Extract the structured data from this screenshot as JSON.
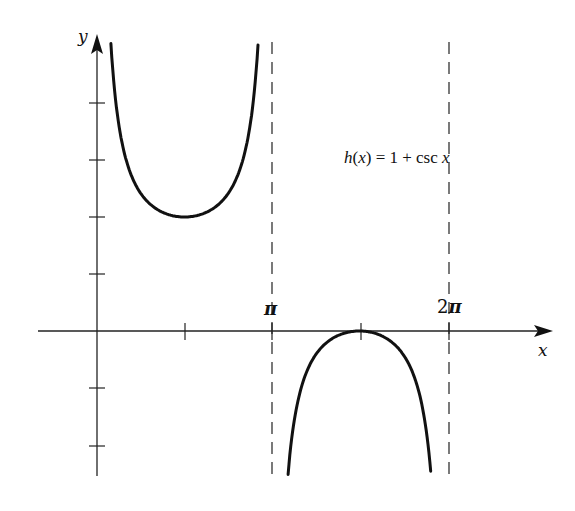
{
  "chart_data": {
    "type": "line",
    "title": "",
    "function": "h(x) = 1 + csc x",
    "equation_label": {
      "name": "h",
      "arg": "x",
      "rhs_const": "1",
      "rhs_func": "csc x"
    },
    "xlabel": "x",
    "ylabel": "y",
    "x_ticks": [
      {
        "value": 1.5708,
        "label": ""
      },
      {
        "value": 3.1416,
        "label": "π"
      },
      {
        "value": 4.7124,
        "label": ""
      },
      {
        "value": 6.2832,
        "label": "2π"
      }
    ],
    "y_ticks": [
      -2,
      -1,
      1,
      2,
      3,
      4
    ],
    "y_tick_labels_shown": false,
    "asymptotes": [
      {
        "x": 3.1416,
        "label": "π",
        "style": "dashed"
      },
      {
        "x": 6.2832,
        "label": "2π",
        "style": "dashed"
      }
    ],
    "series": [
      {
        "name": "upper branch",
        "domain": [
          0.25,
          2.89
        ],
        "key_points": [
          {
            "x": 1.5708,
            "y": 2,
            "kind": "local minimum"
          }
        ]
      },
      {
        "name": "lower branch",
        "domain": [
          3.43,
          5.99
        ],
        "key_points": [
          {
            "x": 4.7124,
            "y": 0,
            "kind": "local maximum"
          }
        ]
      }
    ],
    "xlim": [
      -1.1,
      8.3
    ],
    "ylim": [
      -2.5,
      5.2
    ],
    "grid": false,
    "legend": "none"
  },
  "labels": {
    "x_axis": "x",
    "y_axis": "y",
    "pi": "π",
    "two_pi_coef": "2",
    "two_pi_sym": "π",
    "eq_h": "h",
    "eq_open": "(",
    "eq_x": "x",
    "eq_close": ")",
    "eq_equals": " = ",
    "eq_one": "1",
    "eq_plus": " + ",
    "eq_csc": "csc ",
    "eq_x2": "x"
  },
  "colors": {
    "curve": "#111111",
    "axis": "#222222",
    "asymptote": "#222222",
    "background": "#ffffff"
  }
}
